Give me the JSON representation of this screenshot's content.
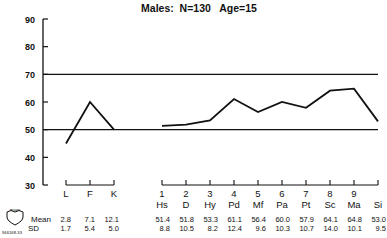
{
  "chart_data": {
    "type": "line",
    "title": "Males:  N=130   Age=15",
    "xlabel": "",
    "ylabel": "",
    "ylim": [
      30,
      90
    ],
    "yticks": [
      30,
      40,
      50,
      60,
      70,
      80,
      90
    ],
    "reference_lines": [
      50,
      70
    ],
    "grid": false,
    "legend": null,
    "series": [
      {
        "name": "Validity scales",
        "categories": [
          "L",
          "F",
          "K"
        ],
        "values": [
          45,
          60,
          50
        ]
      },
      {
        "name": "Clinical scales",
        "categories": [
          "Hs",
          "D",
          "Hy",
          "Pd",
          "Mf",
          "Pa",
          "Pt",
          "Sc",
          "Ma",
          "Si"
        ],
        "numbers": [
          "1",
          "2",
          "3",
          "4",
          "5",
          "6",
          "7",
          "8",
          "9",
          ""
        ],
        "values": [
          51.4,
          51.8,
          53.3,
          61.1,
          56.4,
          60.0,
          57.9,
          64.1,
          64.8,
          53.0
        ]
      }
    ],
    "table": {
      "row_labels": [
        "Mean",
        "SD"
      ],
      "validity": {
        "mean": [
          "2.8",
          "7.1",
          "12.1"
        ],
        "sd": [
          "1.7",
          "5.4",
          "5.0"
        ]
      },
      "clinical": {
        "mean": [
          "51.4",
          "51.8",
          "53.3",
          "61.1",
          "56.4",
          "60.0",
          "57.9",
          "64.1",
          "64.8",
          "53.0"
        ],
        "sd": [
          "8.8",
          "10.5",
          "8.2",
          "12.4",
          "9.6",
          "10.3",
          "10.7",
          "14.0",
          "10.1",
          "9.5"
        ]
      }
    }
  },
  "logo": {
    "label": "mayo",
    "code": "946168-33"
  }
}
